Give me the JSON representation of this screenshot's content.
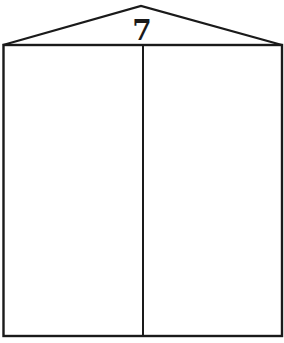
{
  "diagram": {
    "type": "number-house",
    "roof_value": "7",
    "columns": [
      {
        "label": "left-part",
        "value": ""
      },
      {
        "label": "right-part",
        "value": ""
      }
    ],
    "line_color": "#1a1a1a",
    "background": "#ffffff"
  }
}
